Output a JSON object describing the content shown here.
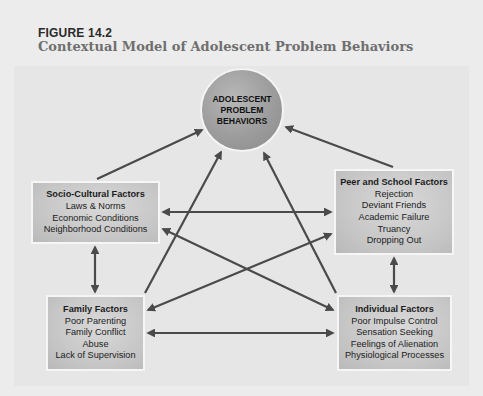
{
  "figure": {
    "label": "FIGURE 14.2",
    "title": "Contextual Model of Adolescent Problem Behaviors"
  },
  "center_node": {
    "lines": [
      "ADOLESCENT",
      "PROBLEM",
      "BEHAVIORS"
    ]
  },
  "nodes": {
    "socio_cultural": {
      "heading": "Socio-Cultural Factors",
      "items": [
        "Laws & Norms",
        "Economic Conditions",
        "Neighborhood Conditions"
      ]
    },
    "peer_school": {
      "heading": "Peer and School Factors",
      "items": [
        "Rejection",
        "Deviant Friends",
        "Academic Failure",
        "Truancy",
        "Dropping Out"
      ]
    },
    "family": {
      "heading": "Family Factors",
      "items": [
        "Poor Parenting",
        "Family Conflict",
        "Abuse",
        "Lack of Supervision"
      ]
    },
    "individual": {
      "heading": "Individual Factors",
      "items": [
        "Poor Impulse Control",
        "Sensation Seeking",
        "Feelings of Alienation",
        "Physiological Processes"
      ]
    }
  },
  "edges": [
    {
      "from": "socio_cultural",
      "to": "center",
      "type": "one-way"
    },
    {
      "from": "peer_school",
      "to": "center",
      "type": "one-way"
    },
    {
      "from": "family",
      "to": "center",
      "type": "one-way"
    },
    {
      "from": "individual",
      "to": "center",
      "type": "one-way"
    },
    {
      "from": "socio_cultural",
      "to": "peer_school",
      "type": "two-way"
    },
    {
      "from": "socio_cultural",
      "to": "individual",
      "type": "two-way"
    },
    {
      "from": "family",
      "to": "peer_school",
      "type": "two-way"
    },
    {
      "from": "family",
      "to": "individual",
      "type": "two-way"
    },
    {
      "from": "socio_cultural",
      "to": "family",
      "type": "two-way"
    },
    {
      "from": "peer_school",
      "to": "individual",
      "type": "two-way"
    }
  ],
  "colors": {
    "arrow": "#4a4a4a",
    "box_fill": "#c8c8c8",
    "circle_fill": "#9e9e9e",
    "title_color": "#6f6f6f"
  }
}
